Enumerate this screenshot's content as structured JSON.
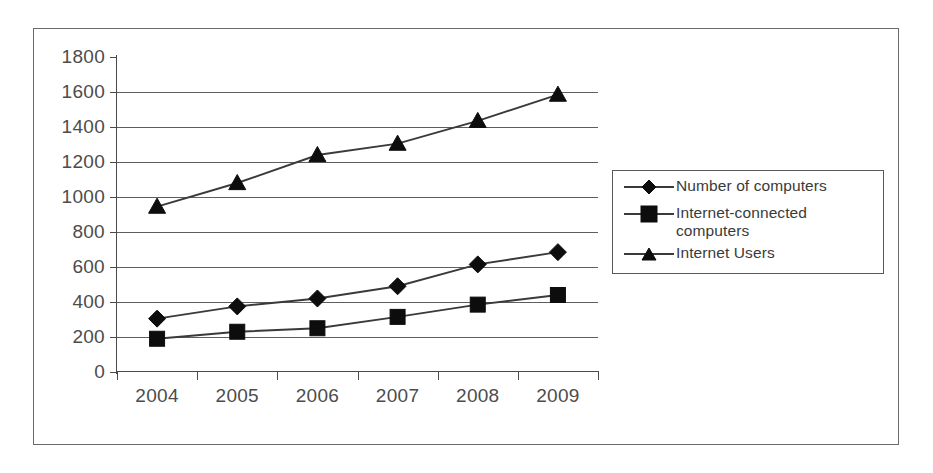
{
  "chart_data": {
    "type": "line",
    "title": "",
    "xlabel": "",
    "ylabel": "",
    "categories": [
      "2004",
      "2005",
      "2006",
      "2007",
      "2008",
      "2009"
    ],
    "ylim": [
      0,
      1800
    ],
    "ytick_labels": [
      "0",
      "200",
      "400",
      "600",
      "800",
      "1000",
      "1200",
      "1400",
      "1600",
      "1800"
    ],
    "ytick_values": [
      0,
      200,
      400,
      600,
      800,
      1000,
      1200,
      1400,
      1600,
      1800
    ],
    "grid": "horizontal",
    "legend_position": "right",
    "series": [
      {
        "name": "Number of computers",
        "marker": "diamond",
        "values": [
          305,
          375,
          420,
          490,
          615,
          685
        ]
      },
      {
        "name": "Internet-connected\ncomputers",
        "marker": "square",
        "values": [
          190,
          230,
          250,
          315,
          385,
          440
        ]
      },
      {
        "name": "Internet Users",
        "marker": "triangle",
        "values": [
          945,
          1080,
          1240,
          1305,
          1435,
          1585
        ]
      }
    ]
  },
  "legend": {
    "entries": [
      {
        "label": "Number of computers",
        "marker": "diamond-marker-icon"
      },
      {
        "label": "Internet-connected\ncomputers",
        "marker": "square-marker-icon"
      },
      {
        "label": "Internet Users",
        "marker": "triangle-marker-icon"
      }
    ]
  },
  "colors": {
    "line": "#3a3a3a",
    "marker": "#0d0d0d",
    "grid": "#5e5e5e",
    "axis": "#4a4a4a",
    "text": "#4c4c4c",
    "frame": "#6a6a6a",
    "background": "#ffffff"
  }
}
